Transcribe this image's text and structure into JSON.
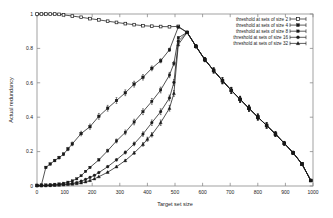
{
  "chart_data": {
    "type": "line",
    "title": "",
    "xlabel": "Target set size",
    "ylabel": "Actual redundancy",
    "xlim": [
      0,
      1000
    ],
    "ylim": [
      0,
      1
    ],
    "grid": false,
    "legend_position": "top-right",
    "xticks": [
      0,
      100,
      200,
      300,
      400,
      500,
      600,
      700,
      800,
      900,
      1000
    ],
    "xtick_labels": [
      "0",
      "100",
      "200",
      "300",
      "400",
      "500",
      "600",
      "700",
      "800",
      "900",
      "1000"
    ],
    "yticks": [
      0,
      0.2,
      0.4,
      0.6,
      0.8,
      1
    ],
    "ytick_labels": [
      "0",
      "0.2",
      "0.4",
      "0.6",
      "0.8",
      "1"
    ],
    "errorbars": true,
    "series": [
      {
        "name": "threshold at sets of size 2",
        "marker": "open-square",
        "x": [
          0,
          16,
          32,
          48,
          64,
          80,
          96,
          128,
          160,
          192,
          224,
          256,
          288,
          320,
          352,
          384,
          416,
          448,
          480,
          512,
          544,
          576,
          608,
          640,
          672,
          704,
          736,
          768,
          800,
          832,
          864,
          896,
          928,
          960,
          992
        ],
        "y": [
          1.0,
          1.0,
          1.0,
          1.0,
          1.0,
          0.998,
          0.995,
          0.988,
          0.981,
          0.973,
          0.966,
          0.958,
          0.951,
          0.944,
          0.938,
          0.932,
          0.929,
          0.927,
          0.926,
          0.928,
          0.893,
          0.812,
          0.735,
          0.672,
          0.612,
          0.556,
          0.504,
          0.452,
          0.401,
          0.352,
          0.302,
          0.248,
          0.193,
          0.128,
          0.032
        ]
      },
      {
        "name": "threshold at sets of size 4",
        "marker": "filled-square",
        "x": [
          0,
          16,
          32,
          48,
          64,
          80,
          96,
          112,
          128,
          160,
          192,
          224,
          256,
          288,
          320,
          352,
          384,
          416,
          448,
          480,
          512,
          544,
          576,
          608,
          640,
          672,
          704,
          736,
          768,
          800,
          832,
          864,
          896,
          928,
          960,
          992
        ],
        "y": [
          0.004,
          0.006,
          0.108,
          0.128,
          0.148,
          0.165,
          0.185,
          0.215,
          0.245,
          0.305,
          0.345,
          0.405,
          0.452,
          0.497,
          0.542,
          0.592,
          0.632,
          0.684,
          0.728,
          0.792,
          0.924,
          0.893,
          0.812,
          0.735,
          0.672,
          0.612,
          0.556,
          0.504,
          0.452,
          0.401,
          0.352,
          0.302,
          0.248,
          0.193,
          0.128,
          0.032
        ]
      },
      {
        "name": "threshold at sets of size 8",
        "marker": "filled-square-small",
        "x": [
          0,
          16,
          32,
          48,
          64,
          80,
          96,
          112,
          128,
          144,
          160,
          176,
          192,
          224,
          256,
          288,
          320,
          352,
          384,
          416,
          448,
          480,
          496,
          512,
          544,
          576,
          608,
          640,
          672,
          704,
          736,
          768,
          800,
          832,
          864,
          896,
          928,
          960,
          992
        ],
        "y": [
          0.002,
          0.004,
          0.006,
          0.008,
          0.01,
          0.012,
          0.016,
          0.022,
          0.03,
          0.042,
          0.06,
          0.085,
          0.108,
          0.152,
          0.205,
          0.262,
          0.312,
          0.372,
          0.432,
          0.492,
          0.558,
          0.645,
          0.712,
          0.862,
          0.893,
          0.812,
          0.735,
          0.672,
          0.612,
          0.556,
          0.504,
          0.452,
          0.401,
          0.352,
          0.302,
          0.248,
          0.193,
          0.128,
          0.032
        ]
      },
      {
        "name": "threshold at sets of size 16",
        "marker": "filled-circle",
        "x": [
          0,
          16,
          32,
          48,
          64,
          80,
          96,
          112,
          128,
          144,
          160,
          176,
          192,
          208,
          224,
          256,
          288,
          320,
          352,
          384,
          416,
          448,
          480,
          496,
          512,
          544,
          576,
          608,
          640,
          672,
          704,
          736,
          768,
          800,
          832,
          864,
          896,
          928,
          960,
          992
        ],
        "y": [
          0.001,
          0.002,
          0.003,
          0.004,
          0.006,
          0.008,
          0.01,
          0.012,
          0.015,
          0.02,
          0.028,
          0.038,
          0.05,
          0.062,
          0.078,
          0.112,
          0.152,
          0.195,
          0.245,
          0.302,
          0.368,
          0.432,
          0.512,
          0.602,
          0.842,
          0.893,
          0.812,
          0.735,
          0.672,
          0.612,
          0.556,
          0.504,
          0.452,
          0.401,
          0.352,
          0.302,
          0.248,
          0.193,
          0.128,
          0.032
        ]
      },
      {
        "name": "threshold at sets of size 32",
        "marker": "filled-triangle",
        "x": [
          0,
          16,
          32,
          48,
          64,
          80,
          96,
          112,
          128,
          144,
          160,
          176,
          192,
          208,
          224,
          256,
          288,
          320,
          352,
          384,
          400,
          416,
          448,
          480,
          496,
          512,
          544,
          576,
          608,
          640,
          672,
          704,
          736,
          768,
          800,
          832,
          864,
          896,
          928,
          960,
          992
        ],
        "y": [
          0.001,
          0.001,
          0.002,
          0.003,
          0.004,
          0.005,
          0.007,
          0.009,
          0.011,
          0.014,
          0.018,
          0.024,
          0.032,
          0.042,
          0.054,
          0.08,
          0.112,
          0.148,
          0.192,
          0.242,
          0.272,
          0.298,
          0.368,
          0.452,
          0.538,
          0.822,
          0.893,
          0.812,
          0.735,
          0.672,
          0.612,
          0.556,
          0.504,
          0.452,
          0.401,
          0.352,
          0.302,
          0.248,
          0.193,
          0.128,
          0.032
        ]
      }
    ]
  },
  "legend": {
    "entries": [
      "threshold at sets of size 2",
      "threshold at sets of size 4",
      "threshold at sets of size 8",
      "threshold at sets of size 16",
      "threshold at sets of size 32"
    ]
  },
  "colors": {
    "line": "#1a1a1a",
    "axis": "#8a8a8a",
    "text": "#1a1a1a",
    "background": "#ffffff"
  }
}
